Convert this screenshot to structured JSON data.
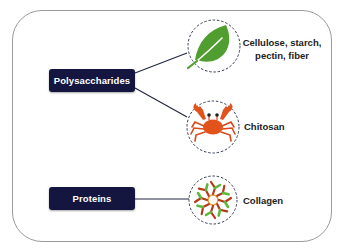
{
  "diagram": {
    "categories": [
      {
        "label": "Polysaccharides",
        "children": [
          "leaf",
          "crab"
        ]
      },
      {
        "label": "Proteins",
        "children": [
          "collagen"
        ]
      }
    ],
    "items": {
      "leaf": {
        "icon": "leaf-icon",
        "label_line1": "Cellulose, starch,",
        "label_line2": "pectin, fiber"
      },
      "crab": {
        "icon": "crab-icon",
        "label": "Chitosan"
      },
      "collagen": {
        "icon": "collagen-molecule-icon",
        "label": "Collagen"
      }
    },
    "colors": {
      "box_fill": "#141640",
      "box_text": "#ffffff",
      "leaf_green": "#4f9e2f",
      "crab_orange": "#e2521b",
      "connector": "#222840",
      "circle_dash": "#333a55"
    }
  }
}
